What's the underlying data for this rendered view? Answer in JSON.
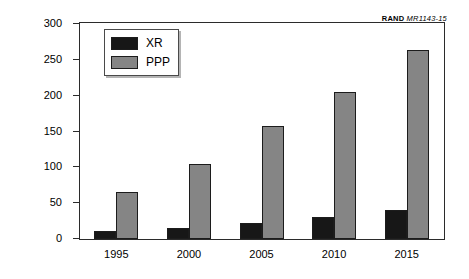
{
  "credit": {
    "organization": "RAND",
    "document_id": "MR1143-15"
  },
  "legend": {
    "position": "inside-top-left",
    "entries": [
      {
        "label": "XR",
        "color": "#171717"
      },
      {
        "label": "PPP",
        "color": "#858585"
      }
    ]
  },
  "axes": {
    "ylabel": "Billions of 1998 U.S. dollars",
    "xlabel": "",
    "yticks": [
      "0",
      "50",
      "100",
      "150",
      "200",
      "250",
      "300"
    ],
    "xticks": [
      "1995",
      "2000",
      "2005",
      "2010",
      "2015"
    ]
  },
  "chart_data": {
    "type": "bar",
    "title": "",
    "subtitle": "",
    "xlabel": "",
    "ylabel": "Billions of 1998 U.S. dollars",
    "categories": [
      "1995",
      "2000",
      "2005",
      "2010",
      "2015"
    ],
    "series": [
      {
        "name": "XR",
        "color": "#171717",
        "values": [
          11,
          16,
          23,
          31,
          41
        ]
      },
      {
        "name": "PPP",
        "color": "#858585",
        "values": [
          65,
          104,
          157,
          205,
          264
        ]
      }
    ],
    "ylim": [
      0,
      300
    ],
    "ytick_step": 50,
    "grid": false,
    "legend_position": "upper left inside plot",
    "annotations": [
      "RAND MR1143-15"
    ]
  }
}
